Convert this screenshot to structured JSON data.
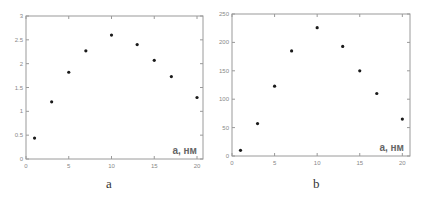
{
  "chart_data": [
    {
      "type": "scatter",
      "panel_label": "a",
      "title": "",
      "xlabel": "a, нм",
      "ylabel": "",
      "xlim": [
        0,
        20.7
      ],
      "ylim": [
        0,
        3
      ],
      "x_ticks": [
        0,
        5,
        10,
        15,
        20
      ],
      "y_ticks": [
        0,
        0.5,
        1,
        1.5,
        2,
        2.5,
        3
      ],
      "y_tick_labels": [
        "0",
        "0.5",
        "1",
        "1.5",
        "2",
        "2.5",
        "3"
      ],
      "grid": false,
      "legend": null,
      "x": [
        1,
        3,
        5,
        7,
        10,
        13,
        15,
        17,
        20
      ],
      "y": [
        0.44,
        1.2,
        1.82,
        2.27,
        2.6,
        2.4,
        2.07,
        1.73,
        1.29
      ]
    },
    {
      "type": "scatter",
      "panel_label": "b",
      "title": "",
      "xlabel": "a, нм",
      "ylabel": "",
      "xlim": [
        0,
        20.9
      ],
      "ylim": [
        0,
        250
      ],
      "x_ticks": [
        0,
        5,
        10,
        15,
        20
      ],
      "y_ticks": [
        0,
        50,
        100,
        150,
        200,
        250
      ],
      "y_tick_labels": [
        "0",
        "50",
        "100",
        "150",
        "200",
        "250"
      ],
      "grid": false,
      "legend": null,
      "x": [
        1,
        3,
        5,
        7,
        10,
        13,
        15,
        17,
        20
      ],
      "y": [
        10,
        57,
        123,
        185,
        226,
        193,
        150,
        110,
        65
      ]
    }
  ],
  "captions": {
    "a": "a",
    "b": "b"
  },
  "colors": {
    "frame": "#9a9a9a",
    "marker": "#1a1a1a",
    "tick_text": "#888888",
    "axis_label": "#666666"
  }
}
